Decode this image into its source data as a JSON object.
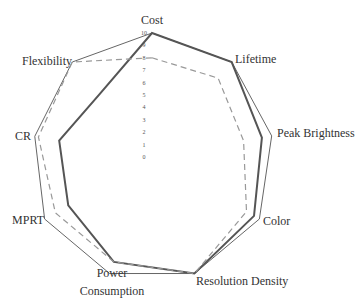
{
  "chart_data": {
    "type": "radar",
    "title": "",
    "axes": [
      "Cost",
      "Lifetime",
      "Peak Brightness",
      "Color",
      "Resolution Density",
      "Power Consumption",
      "MPRT",
      "CR",
      "Flexibility"
    ],
    "axis_label_lines": [
      [
        "Cost"
      ],
      [
        "Lifetime"
      ],
      [
        "Peak Brightness"
      ],
      [
        "Color"
      ],
      [
        "Resolution Density"
      ],
      [
        "Power",
        "Consumption"
      ],
      [
        "MPRT"
      ],
      [
        "CR"
      ],
      [
        "Flexibility"
      ]
    ],
    "range": [
      0,
      10
    ],
    "ticks": [
      "0",
      "1",
      "2",
      "3",
      "4",
      "5",
      "6",
      "7",
      "8",
      "9",
      "10"
    ],
    "grid": false,
    "legend": null,
    "series": [
      {
        "name": "outer (thin solid)",
        "style": "solid-thin",
        "color": "#666666",
        "values": [
          10,
          10,
          9.8,
          10,
          10,
          10,
          10,
          9.6,
          10
        ]
      },
      {
        "name": "thick solid",
        "style": "solid-thick",
        "color": "#555555",
        "values": [
          10,
          10,
          9,
          9.5,
          10,
          9,
          7.8,
          7.6,
          6.6
        ]
      },
      {
        "name": "dashed",
        "style": "dashed",
        "color": "#999999",
        "values": [
          8,
          8.3,
          7.5,
          8.8,
          10,
          9,
          9,
          9.3,
          10
        ]
      }
    ]
  }
}
